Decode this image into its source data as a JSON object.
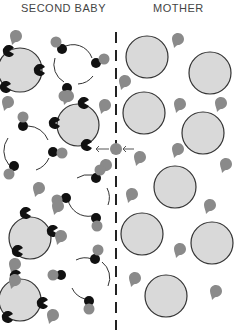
{
  "labels": {
    "left": "SECOND BABY",
    "right": "MOTHER"
  },
  "colors": {
    "cell_fill": "#d9d9d9",
    "cell_stroke": "#333333",
    "drop_fill": "#8a8a8a",
    "antibody_fill": "#111111",
    "divider": "#222222",
    "arrow": "#555555"
  },
  "divider": {
    "x": 116,
    "y1": 32,
    "y2": 330,
    "style": "dashed",
    "meaning": "placenta barrier"
  },
  "arrows": [
    {
      "from": [
        112,
        149
      ],
      "to": [
        96,
        149
      ],
      "direction": "left"
    },
    {
      "from": [
        134,
        149
      ],
      "to": [
        121,
        149
      ],
      "direction": "left"
    }
  ],
  "crossing_drop": {
    "x": 116,
    "y": 149
  },
  "baby_side": {
    "filled_cells": [
      {
        "cx": 20,
        "cy": 70,
        "r": 22
      },
      {
        "cx": 78,
        "cy": 125,
        "r": 21
      },
      {
        "cx": 30,
        "cy": 238,
        "r": 21
      },
      {
        "cx": 20,
        "cy": 300,
        "r": 21
      }
    ],
    "open_rings": [
      {
        "cx": 73,
        "cy": 65,
        "r": 20
      },
      {
        "cx": 27,
        "cy": 148,
        "r": 22
      },
      {
        "cx": 88,
        "cy": 195,
        "r": 21
      },
      {
        "cx": 90,
        "cy": 280,
        "r": 20
      }
    ]
  },
  "mother_side": {
    "cells": [
      {
        "cx": 147,
        "cy": 57,
        "r": 21
      },
      {
        "cx": 210,
        "cy": 73,
        "r": 21
      },
      {
        "cx": 144,
        "cy": 113,
        "r": 21
      },
      {
        "cx": 203,
        "cy": 133,
        "r": 21
      },
      {
        "cx": 175,
        "cy": 187,
        "r": 21
      },
      {
        "cx": 142,
        "cy": 234,
        "r": 21
      },
      {
        "cx": 212,
        "cy": 243,
        "r": 21
      },
      {
        "cx": 166,
        "cy": 296,
        "r": 21
      }
    ]
  }
}
